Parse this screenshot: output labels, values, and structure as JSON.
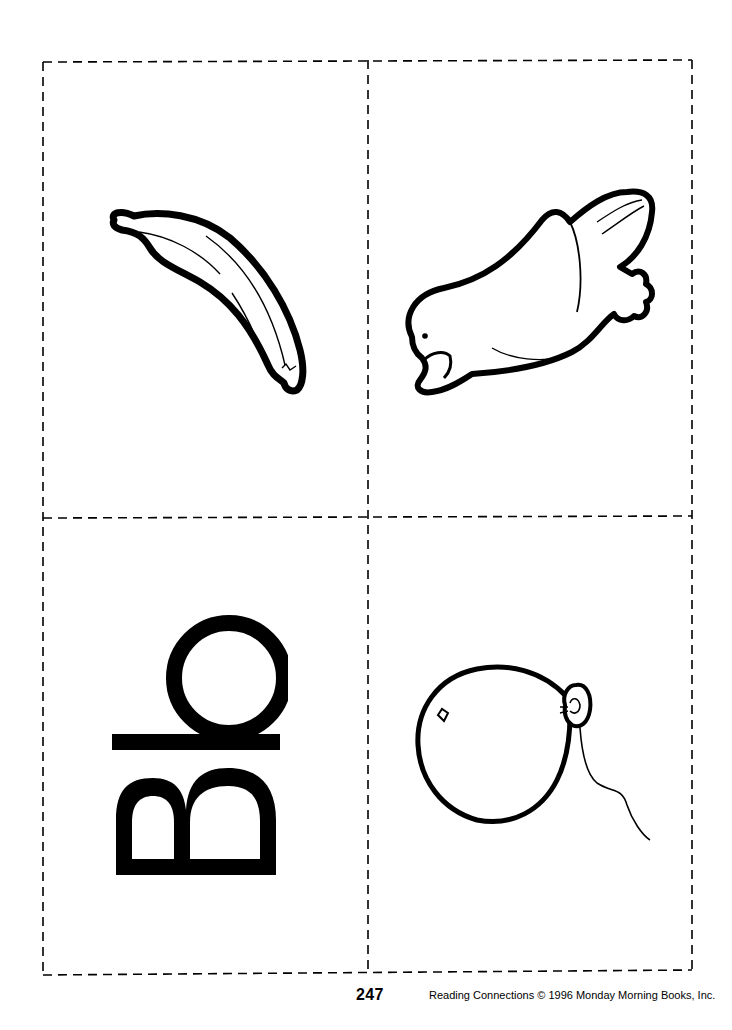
{
  "page": {
    "type": "flashcard-worksheet",
    "layout": "2x2 cut-out card grid with dashed cut lines"
  },
  "cards": [
    {
      "position": "top-left",
      "content": "banana-illustration",
      "icon": "banana-icon"
    },
    {
      "position": "top-right",
      "content": "bird-illustration",
      "icon": "bird-icon"
    },
    {
      "position": "bottom-left",
      "content": "letters",
      "text": "Bb",
      "orientation": "rotated 90deg counter-clockwise"
    },
    {
      "position": "bottom-right",
      "content": "balloon-illustration",
      "icon": "balloon-icon"
    }
  ],
  "footer": {
    "page_number": "247",
    "credit": "Reading Connections © 1996 Monday Morning Books, Inc."
  },
  "colors": {
    "ink": "#000000",
    "paper": "#ffffff"
  }
}
